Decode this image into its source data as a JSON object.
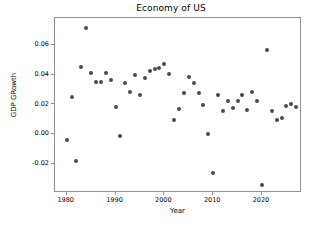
{
  "chart_data": {
    "type": "scatter",
    "title": "Economy of US",
    "xlabel": "Year",
    "ylabel": "GDP GRowth",
    "xlim": [
      1977.6,
      1980.0
    ],
    "x_axis_range": [
      1977.6,
      2028.2
    ],
    "ylim": [
      -0.0395,
      0.0785
    ],
    "grid": false,
    "legend": null,
    "marker_color": "#4a4a4a",
    "marker_size_px": 4,
    "xticks": [
      1980,
      1990,
      2000,
      2010,
      2020
    ],
    "xticklabels": [
      "1980",
      "1990",
      "2000",
      "2010",
      "2020"
    ],
    "yticks": [
      0.06,
      0.04,
      0.02,
      0.0,
      -0.02
    ],
    "yticklabels": [
      "0.06",
      "0.04",
      "0.02",
      "0.00",
      "-0.02"
    ],
    "x": [
      1980,
      1981,
      1982,
      1983,
      1984,
      1985,
      1986,
      1987,
      1988,
      1989,
      1990,
      1991,
      1992,
      1993,
      1994,
      1995,
      1996,
      1997,
      1998,
      1999,
      2000,
      2001,
      2002,
      2003,
      2004,
      2005,
      2006,
      2007,
      2008,
      2009,
      2010,
      2011,
      2012,
      2013,
      2014,
      2015,
      2016,
      2017,
      2018,
      2019,
      2020,
      2021,
      2022,
      2023,
      2024,
      2025,
      2026,
      2027
    ],
    "y": [
      -0.0035,
      0.0249,
      -0.0181,
      0.0455,
      0.0715,
      0.0417,
      0.0351,
      0.0351,
      0.0417,
      0.0369,
      0.0188,
      -0.0013,
      0.0348,
      0.0283,
      0.04,
      0.0268,
      0.0378,
      0.0428,
      0.0441,
      0.0448,
      0.0475,
      0.0406,
      0.0098,
      0.017,
      0.0281,
      0.039,
      0.035,
      0.0279,
      0.0196,
      0.0005,
      -0.0262,
      0.0266,
      0.0158,
      0.0224,
      0.018,
      0.0226,
      0.0268,
      0.0168,
      0.0288,
      0.0226,
      -0.0338,
      0.0572,
      0.0155,
      0.0097,
      0.0113,
      0.019,
      0.0208,
      0.0188
    ],
    "series_name": "GDP Growth"
  },
  "figure": {
    "background_color": "#ffffff",
    "frame_color": "#8f8f8f"
  }
}
